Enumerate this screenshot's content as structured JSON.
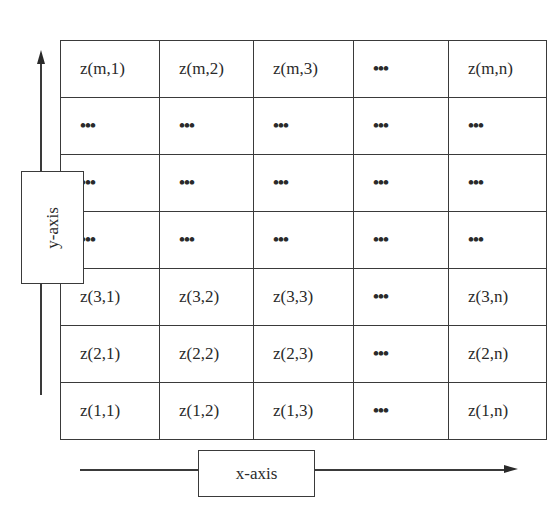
{
  "diagram": {
    "y_axis_label": "y-axis",
    "x_axis_label": "x-axis",
    "grid": {
      "rows": [
        [
          "z(m,1)",
          "z(m,2)",
          "z(m,3)",
          "...",
          "z(m,n)"
        ],
        [
          "...",
          "...",
          "...",
          "...",
          "..."
        ],
        [
          "...",
          "...",
          "...",
          "...",
          "..."
        ],
        [
          "...",
          "...",
          "...",
          "...",
          "..."
        ],
        [
          "z(3,1)",
          "z(3,2)",
          "z(3,3)",
          "...",
          "z(3,n)"
        ],
        [
          "z(2,1)",
          "z(2,2)",
          "z(2,3)",
          "...",
          "z(2,n)"
        ],
        [
          "z(1,1)",
          "z(1,2)",
          "z(1,3)",
          "...",
          "z(1,n)"
        ]
      ]
    }
  }
}
